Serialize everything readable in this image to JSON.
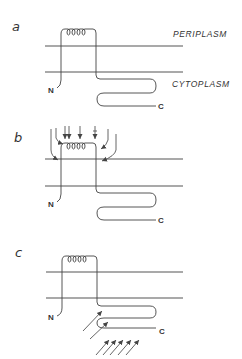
{
  "figure": {
    "panels": [
      {
        "id": "a",
        "label": "a",
        "region_labels": {
          "top": "PERIPLASM",
          "bottom": "CYTOPLASM"
        },
        "n_terminus": "N",
        "c_terminus": "C",
        "arrows": "none"
      },
      {
        "id": "b",
        "label": "b",
        "n_terminus": "N",
        "c_terminus": "C",
        "arrows": "periplasmic helix loop attacked from above"
      },
      {
        "id": "c",
        "label": "c",
        "n_terminus": "N",
        "c_terminus": "C",
        "arrows": "cytoplasmic C-terminal domain attacked from below"
      }
    ],
    "colors": {
      "line": "#444444",
      "text": "#333333",
      "background": "#ffffff"
    }
  }
}
